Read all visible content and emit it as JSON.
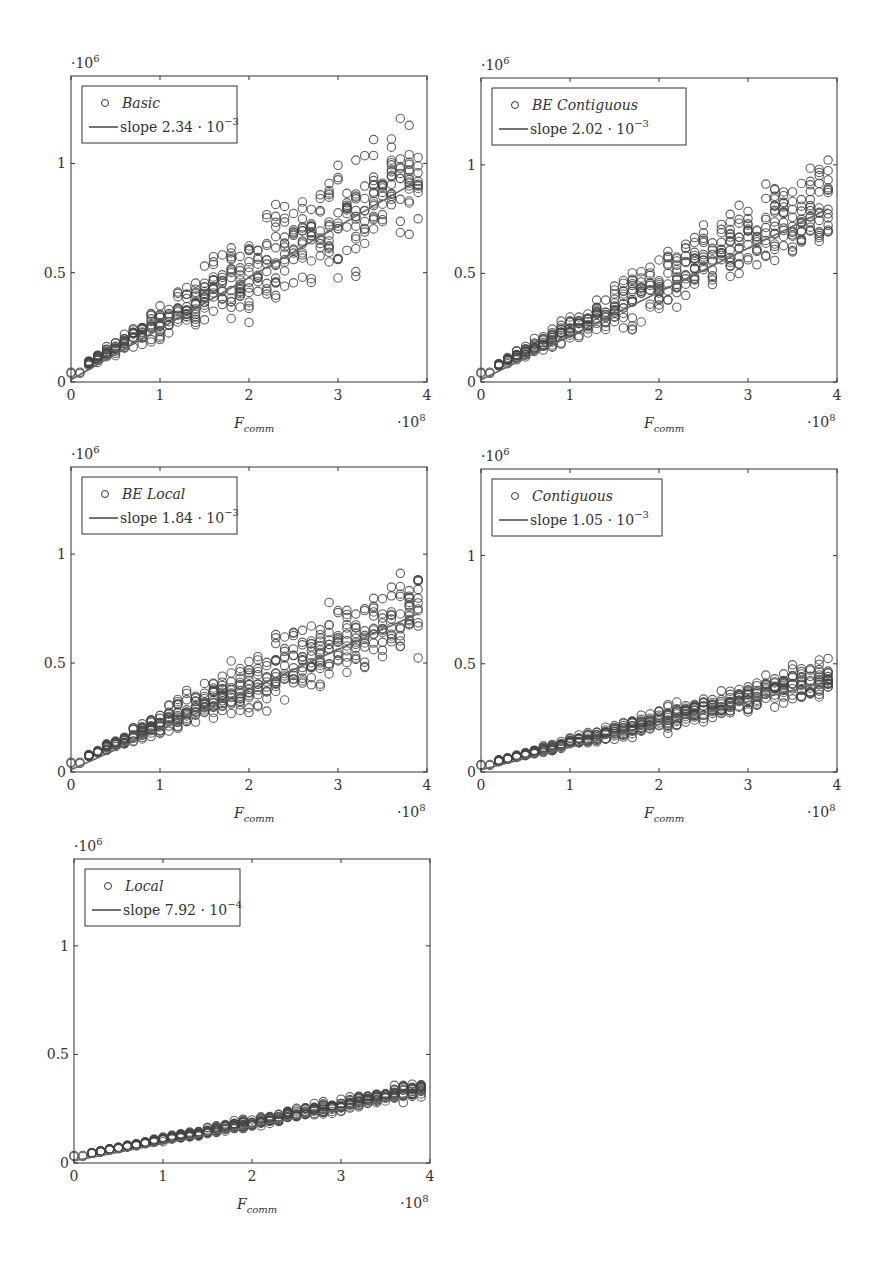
{
  "figure": {
    "ylabel_multiplier": "·10",
    "ylabel_exponent": "6",
    "xlabel_multiplier": "·10",
    "xlabel_exponent": "8",
    "xlabel_main": "F",
    "xlabel_sub": "comm"
  },
  "chart_data": [
    {
      "type": "scatter",
      "title": "Basic",
      "legend": [
        "Basic",
        "slope 2.34 · 10^-3"
      ],
      "slope_text": "slope 2.34 · 10",
      "slope_exp": "−3",
      "slope": 0.00234,
      "xlabel": "F_comm (·10^8)",
      "ylabel": "(·10^6)",
      "xticks": [
        0,
        1,
        2,
        3,
        4
      ],
      "yticks": [
        0,
        0.5,
        1
      ],
      "xlim": [
        0,
        4
      ],
      "ylim": [
        0,
        1.33
      ],
      "intercept": 0.04,
      "spread": 0.15,
      "x_columns_1e8": [
        0,
        0.1,
        0.2,
        0.3,
        0.4,
        0.5,
        0.6,
        0.7,
        0.8,
        0.9,
        1.0,
        1.1,
        1.2,
        1.3,
        1.4,
        1.5,
        1.6,
        1.7,
        1.8,
        1.9,
        2.0,
        2.1,
        2.2,
        2.3,
        2.4,
        2.5,
        2.6,
        2.7,
        2.8,
        2.9,
        3.0,
        3.1,
        3.2,
        3.3,
        3.4,
        3.5,
        3.6,
        3.7,
        3.8,
        3.9
      ],
      "y_range_at_x4": [
        0.69,
        1.28
      ],
      "panel": {
        "left": 71,
        "top": 76,
        "right": 427,
        "bottom": 382
      }
    },
    {
      "type": "scatter",
      "title": "BE Contiguous",
      "legend": [
        "BE Contiguous",
        "slope 2.02 · 10^-3"
      ],
      "slope_text": "slope 2.02 · 10",
      "slope_exp": "−3",
      "slope": 0.00202,
      "xticks": [
        0,
        1,
        2,
        3,
        4
      ],
      "yticks": [
        0,
        0.5,
        1
      ],
      "xlim": [
        0,
        4
      ],
      "ylim": [
        0,
        1.33
      ],
      "intercept": 0.04,
      "spread": 0.12,
      "y_range_at_x4": [
        0.6,
        1.08
      ],
      "panel": {
        "left": 481,
        "top": 78,
        "right": 837,
        "bottom": 382
      }
    },
    {
      "type": "scatter",
      "title": "BE Local",
      "legend": [
        "BE Local",
        "slope 1.84 · 10^-3"
      ],
      "slope_text": "slope 1.84 · 10",
      "slope_exp": "−3",
      "slope": 0.00184,
      "xticks": [
        0,
        1,
        2,
        3,
        4
      ],
      "yticks": [
        0,
        0.5,
        1
      ],
      "xlim": [
        0,
        4
      ],
      "ylim": [
        0,
        1.33
      ],
      "intercept": 0.04,
      "spread": 0.11,
      "y_range_at_x4": [
        0.58,
        1.0
      ],
      "panel": {
        "left": 71,
        "top": 467,
        "right": 427,
        "bottom": 772
      }
    },
    {
      "type": "scatter",
      "title": "Contiguous",
      "legend": [
        "Contiguous",
        "slope 1.05 · 10^-3"
      ],
      "slope_text": "slope 1.05 · 10",
      "slope_exp": "−3",
      "slope": 0.00105,
      "xticks": [
        0,
        1,
        2,
        3,
        4
      ],
      "yticks": [
        0,
        0.5,
        1
      ],
      "xlim": [
        0,
        4
      ],
      "ylim": [
        0,
        1.33
      ],
      "intercept": 0.03,
      "spread": 0.045,
      "y_range_at_x4": [
        0.35,
        0.52
      ],
      "panel": {
        "left": 481,
        "top": 469,
        "right": 837,
        "bottom": 772
      }
    },
    {
      "type": "scatter",
      "title": "Local",
      "legend": [
        "Local",
        "slope 7.92 · 10^-4"
      ],
      "slope_text": "slope 7.92 · 10",
      "slope_exp": "−4",
      "slope": 0.000792,
      "xticks": [
        0,
        1,
        2,
        3,
        4
      ],
      "yticks": [
        0,
        0.5,
        1
      ],
      "xlim": [
        0,
        4
      ],
      "ylim": [
        0,
        1.33
      ],
      "intercept": 0.03,
      "spread": 0.02,
      "y_range_at_x4": [
        0.3,
        0.36
      ],
      "panel": {
        "left": 74,
        "top": 859,
        "right": 430,
        "bottom": 1163
      }
    }
  ]
}
